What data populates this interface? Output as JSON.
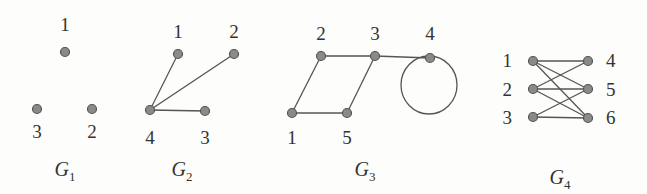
{
  "figure": {
    "graphs": [
      {
        "id": "G1",
        "caption": {
          "letter": "G",
          "sub": "1"
        },
        "nodes": [
          {
            "label": "1",
            "x": 65,
            "y": 52,
            "lx": 65,
            "ly": 31
          },
          {
            "label": "3",
            "x": 37,
            "y": 109,
            "lx": 37,
            "ly": 138
          },
          {
            "label": "2",
            "x": 92,
            "y": 109,
            "lx": 92,
            "ly": 138
          }
        ],
        "edges": [],
        "loops": []
      },
      {
        "id": "G2",
        "caption": {
          "letter": "G",
          "sub": "2"
        },
        "nodes": [
          {
            "label": "1",
            "x": 178,
            "y": 54,
            "lx": 178,
            "ly": 38
          },
          {
            "label": "2",
            "x": 234,
            "y": 54,
            "lx": 234,
            "ly": 38
          },
          {
            "label": "4",
            "x": 150,
            "y": 110,
            "lx": 150,
            "ly": 144
          },
          {
            "label": "3",
            "x": 205,
            "y": 111,
            "lx": 205,
            "ly": 144
          }
        ],
        "edges": [
          [
            "4",
            "1"
          ],
          [
            "4",
            "2"
          ],
          [
            "4",
            "3"
          ]
        ],
        "loops": []
      },
      {
        "id": "G3",
        "caption": {
          "letter": "G",
          "sub": "3"
        },
        "nodes": [
          {
            "label": "2",
            "x": 321,
            "y": 56,
            "lx": 321,
            "ly": 40
          },
          {
            "label": "3",
            "x": 375,
            "y": 56,
            "lx": 375,
            "ly": 40
          },
          {
            "label": "4",
            "x": 430,
            "y": 58,
            "lx": 430,
            "ly": 40
          },
          {
            "label": "1",
            "x": 292,
            "y": 113,
            "lx": 292,
            "ly": 144
          },
          {
            "label": "5",
            "x": 347,
            "y": 113,
            "lx": 347,
            "ly": 144
          }
        ],
        "edges": [
          [
            "2",
            "3"
          ],
          [
            "3",
            "4"
          ],
          [
            "2",
            "1"
          ],
          [
            "1",
            "5"
          ],
          [
            "5",
            "3"
          ]
        ],
        "loops": [
          {
            "node": "4",
            "cx": 429,
            "cy": 85,
            "rx": 28,
            "ry": 29
          }
        ]
      },
      {
        "id": "G4",
        "caption": {
          "letter": "G",
          "sub": "4"
        },
        "nodes": [
          {
            "label": "1",
            "x": 533,
            "y": 61,
            "lx": 512,
            "ly": 67,
            "anchor": "end"
          },
          {
            "label": "2",
            "x": 533,
            "y": 89,
            "lx": 512,
            "ly": 96,
            "anchor": "end"
          },
          {
            "label": "3",
            "x": 533,
            "y": 117,
            "lx": 512,
            "ly": 124,
            "anchor": "end"
          },
          {
            "label": "4",
            "x": 588,
            "y": 61,
            "lx": 606,
            "ly": 67,
            "anchor": "start"
          },
          {
            "label": "5",
            "x": 588,
            "y": 89,
            "lx": 606,
            "ly": 96,
            "anchor": "start"
          },
          {
            "label": "6",
            "x": 588,
            "y": 118,
            "lx": 606,
            "ly": 124,
            "anchor": "start"
          }
        ],
        "edges": [
          [
            "1",
            "4"
          ],
          [
            "1",
            "5"
          ],
          [
            "1",
            "6"
          ],
          [
            "2",
            "4"
          ],
          [
            "2",
            "5"
          ],
          [
            "2",
            "6"
          ],
          [
            "3",
            "5"
          ],
          [
            "3",
            "6"
          ]
        ],
        "loops": []
      }
    ],
    "captions_pos": [
      {
        "x": 65,
        "y": 176
      },
      {
        "x": 182,
        "y": 176
      },
      {
        "x": 365,
        "y": 176
      },
      {
        "x": 560,
        "y": 184
      }
    ]
  }
}
